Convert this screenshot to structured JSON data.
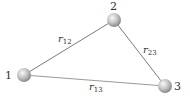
{
  "diagram": {
    "type": "three-body-distance-triangle",
    "nodes": [
      {
        "id": "1",
        "label": "1",
        "x": 24,
        "y": 75
      },
      {
        "id": "2",
        "label": "2",
        "x": 114,
        "y": 20
      },
      {
        "id": "3",
        "label": "3",
        "x": 165,
        "y": 86
      }
    ],
    "edges": [
      {
        "from": "1",
        "to": "2",
        "label": "r",
        "subscript": "12"
      },
      {
        "from": "2",
        "to": "3",
        "label": "r",
        "subscript": "23"
      },
      {
        "from": "1",
        "to": "3",
        "label": "r",
        "subscript": "13"
      }
    ],
    "colors": {
      "line": "#7a7a7a",
      "sphere_light": "#f4f4f4",
      "sphere_dark": "#8e8e8e",
      "text": "#333333"
    }
  }
}
